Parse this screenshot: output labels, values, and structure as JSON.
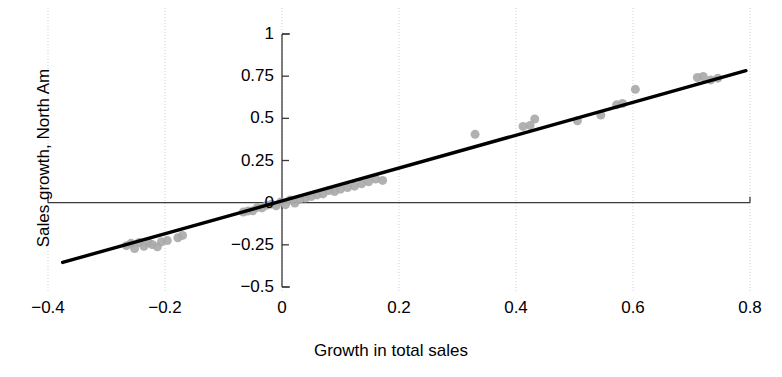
{
  "figure": {
    "background_color": "#ffffff",
    "point_color": "#a9a9a9",
    "line_color": "#000000",
    "grid_color": "#d9d9d9",
    "axis_color": "#3a3a3a"
  },
  "chart_data": {
    "type": "scatter",
    "title": "",
    "xlabel": "Growth in total sales",
    "ylabel": "Sales growth, North Am",
    "xlim": [
      -0.4,
      0.8
    ],
    "ylim": [
      -0.5,
      1
    ],
    "xticks": [
      -0.4,
      -0.2,
      0,
      0.2,
      0.4,
      0.6,
      0.8
    ],
    "xticklabels": [
      "−0.4",
      "−0.2",
      "0",
      "0.2",
      "0.4",
      "0.6",
      "0.8"
    ],
    "yticks": [
      -0.5,
      -0.25,
      0,
      0.25,
      0.5,
      0.75,
      1
    ],
    "yticklabels": [
      "−0.5",
      "−0.25",
      "0",
      "0.25",
      "0.5",
      "0.75",
      "1"
    ],
    "grid": true,
    "grid_style": "dotted-vertical",
    "legend": null,
    "marker_size": 9,
    "points": [
      [
        -0.266,
        -0.255
      ],
      [
        -0.258,
        -0.241
      ],
      [
        -0.252,
        -0.272
      ],
      [
        -0.244,
        -0.236
      ],
      [
        -0.236,
        -0.259
      ],
      [
        -0.228,
        -0.238
      ],
      [
        -0.222,
        -0.248
      ],
      [
        -0.213,
        -0.262
      ],
      [
        -0.206,
        -0.232
      ],
      [
        -0.196,
        -0.225
      ],
      [
        -0.178,
        -0.208
      ],
      [
        -0.17,
        -0.194
      ],
      [
        -0.066,
        -0.055
      ],
      [
        -0.058,
        -0.049
      ],
      [
        -0.05,
        -0.048
      ],
      [
        -0.042,
        -0.028
      ],
      [
        -0.034,
        -0.031
      ],
      [
        -0.026,
        -0.015
      ],
      [
        -0.018,
        -0.009
      ],
      [
        -0.01,
        -0.019
      ],
      [
        -0.002,
        0.004
      ],
      [
        0.006,
        -0.012
      ],
      [
        0.014,
        0.016
      ],
      [
        0.022,
        -0.002
      ],
      [
        0.03,
        0.02
      ],
      [
        0.04,
        0.028
      ],
      [
        0.05,
        0.036
      ],
      [
        0.06,
        0.046
      ],
      [
        0.07,
        0.052
      ],
      [
        0.08,
        0.072
      ],
      [
        0.09,
        0.066
      ],
      [
        0.1,
        0.08
      ],
      [
        0.112,
        0.09
      ],
      [
        0.124,
        0.098
      ],
      [
        0.136,
        0.112
      ],
      [
        0.148,
        0.124
      ],
      [
        0.16,
        0.14
      ],
      [
        0.172,
        0.132
      ],
      [
        0.33,
        0.405
      ],
      [
        0.412,
        0.452
      ],
      [
        0.424,
        0.458
      ],
      [
        0.432,
        0.496
      ],
      [
        0.505,
        0.486
      ],
      [
        0.545,
        0.52
      ],
      [
        0.572,
        0.58
      ],
      [
        0.582,
        0.588
      ],
      [
        0.604,
        0.672
      ],
      [
        0.71,
        0.742
      ],
      [
        0.72,
        0.748
      ],
      [
        0.733,
        0.728
      ],
      [
        0.745,
        0.738
      ]
    ],
    "fit_line": {
      "slope": 0.9733,
      "intercept": 0.0108,
      "x_start": -0.375,
      "x_end": 0.793
    }
  },
  "axes": {
    "x_label": "Growth in total sales",
    "y_label": "Sales growth, North Am"
  },
  "x_tick_labels": [
    "−0.4",
    "−0.2",
    "0",
    "0.2",
    "0.4",
    "0.6",
    "0.8"
  ],
  "y_tick_labels": [
    "1",
    "0.75",
    "0.5",
    "0.25",
    "0",
    "−0.25",
    "−0.5"
  ]
}
